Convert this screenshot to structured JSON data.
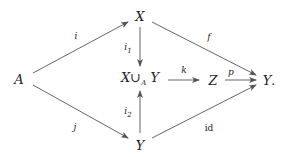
{
  "diagram": {
    "type": "commutative-diagram",
    "nodes": {
      "A": {
        "text": "A"
      },
      "X": {
        "text": "X"
      },
      "pushout": {
        "left": "X",
        "cup": "∪",
        "sub": "A",
        "right": "Y"
      },
      "Ybottom": {
        "text": "Y"
      },
      "Z": {
        "text": "Z"
      },
      "Yright": {
        "text": "Y",
        "punct": "."
      }
    },
    "arrows": [
      {
        "from": "A",
        "to": "X",
        "label": "i"
      },
      {
        "from": "A",
        "to": "Y (bottom)",
        "label": "j"
      },
      {
        "from": "X",
        "to": "X ∪_A Y",
        "label": "i",
        "label_sub": "1"
      },
      {
        "from": "Y (bottom)",
        "to": "X ∪_A Y",
        "label": "i",
        "label_sub": "2"
      },
      {
        "from": "X ∪_A Y",
        "to": "Z",
        "label": "k"
      },
      {
        "from": "X",
        "to": "Y (right)",
        "label": "f"
      },
      {
        "from": "Z",
        "to": "Y (right)",
        "label": "p"
      },
      {
        "from": "Y (bottom)",
        "to": "Y (right)",
        "label": "id"
      }
    ],
    "labels": {
      "i": "i",
      "j": "j",
      "i1": {
        "base": "i",
        "sub": "1"
      },
      "i2": {
        "base": "i",
        "sub": "2"
      },
      "k": "k",
      "f": "f",
      "p": "p",
      "id": "id"
    },
    "stroke_color": "#555555"
  }
}
